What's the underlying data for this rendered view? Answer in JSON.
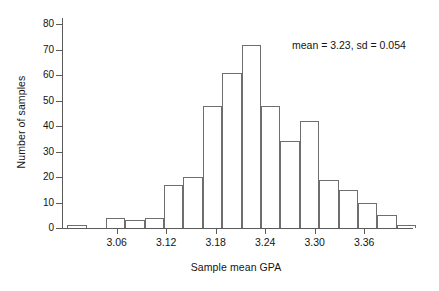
{
  "chart_data": {
    "type": "bar",
    "title": "",
    "subtitle": "",
    "xlabel": "Sample mean GPA",
    "ylabel": "Number of samples",
    "ylim": [
      0,
      82
    ],
    "xlim": [
      2.995,
      3.418
    ],
    "grid": false,
    "legend": null,
    "yticks": [
      0,
      10,
      20,
      30,
      40,
      50,
      60,
      70,
      80
    ],
    "ytick_labels": [
      "0",
      "10",
      "20",
      "30",
      "40",
      "50",
      "60",
      "70",
      "80"
    ],
    "xticks": [
      3.06,
      3.12,
      3.18,
      3.24,
      3.3,
      3.36
    ],
    "xtick_labels": [
      "3.06",
      "3.12",
      "3.18",
      "3.24",
      "3.30",
      "3.36"
    ],
    "bin_width": 0.0235,
    "bin_edges": [
      3.0,
      3.0235,
      3.047,
      3.0705,
      3.094,
      3.1175,
      3.141,
      3.1645,
      3.188,
      3.2115,
      3.235,
      3.2585,
      3.282,
      3.3055,
      3.329,
      3.3525,
      3.376,
      3.3995,
      3.423
    ],
    "bin_centers": [
      3.0118,
      3.0353,
      3.0588,
      3.0823,
      3.1058,
      3.1293,
      3.1528,
      3.1763,
      3.1998,
      3.2233,
      3.2468,
      3.2703,
      3.2938,
      3.3173,
      3.3408,
      3.3643,
      3.3878,
      3.4113
    ],
    "categories": [
      "3.000-3.024",
      "3.024-3.047",
      "3.047-3.071",
      "3.071-3.094",
      "3.094-3.118",
      "3.118-3.141",
      "3.141-3.165",
      "3.165-3.188",
      "3.188-3.212",
      "3.212-3.235",
      "3.235-3.259",
      "3.259-3.282",
      "3.282-3.306",
      "3.306-3.329",
      "3.329-3.353",
      "3.353-3.376",
      "3.376-3.400",
      "3.400-3.423"
    ],
    "values": [
      1,
      0,
      4,
      3,
      4,
      17,
      20,
      48,
      61,
      72,
      48,
      34,
      42,
      19,
      15,
      10,
      5,
      1
    ],
    "annotations": [
      {
        "text": "mean = 3.23, sd = 0.054",
        "x": 3.3,
        "y": 76
      }
    ],
    "statistics": {
      "mean": 3.23,
      "sd": 0.054
    },
    "colors": {
      "bar_stroke": "#6e6e6e",
      "bar_fill": "transparent",
      "axis": "#5b5b5b",
      "text": "#141414",
      "background": "#ffffff"
    }
  }
}
